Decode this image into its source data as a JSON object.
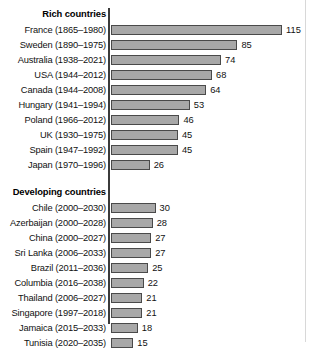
{
  "chart_data": {
    "type": "bar",
    "orientation": "horizontal",
    "title": "",
    "xlabel": "",
    "ylabel": "",
    "xlim": [
      0,
      115
    ],
    "grid": false,
    "legend": "none",
    "groups": [
      {
        "heading": "Rich countries",
        "categories": [
          "France (1865–1980)",
          "Sweden (1890–1975)",
          "Australia (1938–2021)",
          "USA (1944–2012)",
          "Canada (1944–2008)",
          "Hungary (1941–1994)",
          "Poland (1966–2012)",
          "UK (1930–1975)",
          "Spain (1947–1992)",
          "Japan (1970–1996)"
        ],
        "values": [
          115,
          85,
          74,
          68,
          64,
          53,
          46,
          45,
          45,
          26
        ]
      },
      {
        "heading": "Developing countries",
        "categories": [
          "Chile (2000–2030)",
          "Azerbaijan (2000–2028)",
          "China (2000–2027)",
          "Sri Lanka (2006–2033)",
          "Brazil (2011–2036)",
          "Columbia (2016–2038)",
          "Thailand (2006–2027)",
          "Singapore (1997–2018)",
          "Jamaica (2015–2033)",
          "Tunisia (2020–2035)"
        ],
        "values": [
          30,
          28,
          27,
          27,
          25,
          22,
          21,
          21,
          18,
          15
        ]
      }
    ],
    "colors": {
      "bar_fill": "#a8a8a8",
      "bar_border": "#4a4a4a",
      "axis": "#3b3b3b",
      "text": "#111111",
      "background": "#ffffff"
    }
  }
}
